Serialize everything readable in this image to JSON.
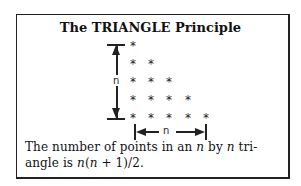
{
  "title": "The TRIANGLE Principle",
  "diagram": {
    "symbol": "*",
    "rows": [
      1,
      2,
      3,
      4,
      5
    ],
    "vertical_label": "n",
    "horizontal_label": "n"
  },
  "caption": {
    "line1_prefix": "The number of points in an ",
    "var1": "n",
    "line1_mid": " by ",
    "var2": "n",
    "line1_suffix": " tri-",
    "line2_prefix": "angle is ",
    "formula_var_a": "n",
    "formula_open": "(",
    "formula_var_b": "n",
    "formula_rest": " + 1)/2."
  }
}
